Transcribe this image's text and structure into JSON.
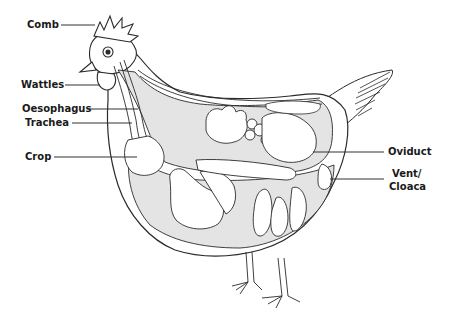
{
  "diagram": {
    "colors": {
      "outline": "#2a2a2a",
      "organ_fill": "#e4e4e4",
      "organ_white": "#ffffff",
      "label_text": "#1a1a1a",
      "leader_line": "#333333"
    },
    "labels": [
      {
        "id": "comb",
        "text": "Comb",
        "side": "left"
      },
      {
        "id": "wattles",
        "text": "Wattles",
        "side": "left"
      },
      {
        "id": "oesophagus",
        "text": "Oesophagus",
        "side": "left"
      },
      {
        "id": "trachea",
        "text": "Trachea",
        "side": "left"
      },
      {
        "id": "crop",
        "text": "Crop",
        "side": "left"
      },
      {
        "id": "oviduct",
        "text": "Oviduct",
        "side": "right"
      },
      {
        "id": "vent",
        "text": "Vent/",
        "text2": "Cloaca",
        "side": "right"
      }
    ]
  }
}
